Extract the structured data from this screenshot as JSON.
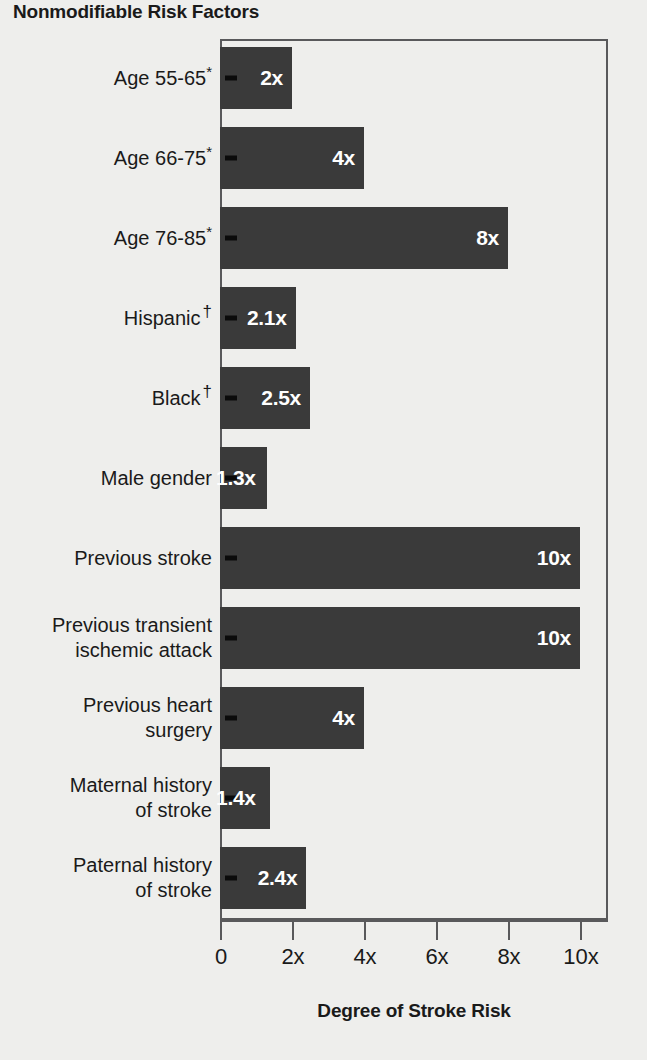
{
  "chart_data": {
    "type": "bar",
    "orientation": "horizontal",
    "title": "Nonmodifiable Risk Factors",
    "xlabel": "Degree of Stroke Risk",
    "ylabel": "",
    "xlim": [
      0,
      10.8
    ],
    "grid": false,
    "legend": null,
    "tick_labels": [
      "0",
      "2x",
      "4x",
      "6x",
      "8x",
      "10x"
    ],
    "tick_values": [
      0,
      2,
      4,
      6,
      8,
      10
    ],
    "categories": [
      "Age 55-65*",
      "Age 66-75*",
      "Age 76-85*",
      "Hispanic †",
      "Black †",
      "Male gender",
      "Previous stroke",
      "Previous transient ischemic attack",
      "Previous heart surgery",
      "Maternal history of stroke",
      "Paternal history of stroke"
    ],
    "values": [
      2,
      4,
      8,
      2.1,
      2.5,
      1.3,
      10,
      10,
      4,
      1.4,
      2.4
    ],
    "value_labels": [
      "2x",
      "4x",
      "8x",
      "2.1x",
      "2.5x",
      "1.3x",
      "10x",
      "10x",
      "4x",
      "1.4x",
      "2.4x"
    ],
    "bar_color": "#3a3a3a",
    "value_label_color": "#ffffff",
    "background_color": "#eeeeec",
    "axis_color": "#59595b",
    "footnote_markers": [
      "*",
      "†"
    ]
  },
  "rows": [
    {
      "label_line1": "Age 55-65",
      "label_line2": "",
      "marker": "*",
      "marker_style": "sup",
      "value": 2,
      "value_label": "2x",
      "label_overflow": false
    },
    {
      "label_line1": "Age 66-75",
      "label_line2": "",
      "marker": "*",
      "marker_style": "sup",
      "value": 4,
      "value_label": "4x",
      "label_overflow": false
    },
    {
      "label_line1": "Age 76-85",
      "label_line2": "",
      "marker": "*",
      "marker_style": "sup",
      "value": 8,
      "value_label": "8x",
      "label_overflow": false
    },
    {
      "label_line1": "Hispanic",
      "label_line2": "",
      "marker": "†",
      "marker_style": "dag",
      "value": 2.1,
      "value_label": "2.1x",
      "label_overflow": false
    },
    {
      "label_line1": "Black",
      "label_line2": "",
      "marker": "†",
      "marker_style": "dag",
      "value": 2.5,
      "value_label": "2.5x",
      "label_overflow": false
    },
    {
      "label_line1": "Male gender",
      "label_line2": "",
      "marker": "",
      "marker_style": "",
      "value": 1.3,
      "value_label": "1.3x",
      "label_overflow": true
    },
    {
      "label_line1": "Previous stroke",
      "label_line2": "",
      "marker": "",
      "marker_style": "",
      "value": 10,
      "value_label": "10x",
      "label_overflow": false
    },
    {
      "label_line1": "Previous transient",
      "label_line2": "ischemic attack",
      "marker": "",
      "marker_style": "",
      "value": 10,
      "value_label": "10x",
      "label_overflow": false
    },
    {
      "label_line1": "Previous heart",
      "label_line2": "surgery",
      "marker": "",
      "marker_style": "",
      "value": 4,
      "value_label": "4x",
      "label_overflow": false
    },
    {
      "label_line1": "Maternal history",
      "label_line2": "of stroke",
      "marker": "",
      "marker_style": "",
      "value": 1.4,
      "value_label": "1.4x",
      "label_overflow": true
    },
    {
      "label_line1": "Paternal history",
      "label_line2": "of stroke",
      "marker": "",
      "marker_style": "",
      "value": 2.4,
      "value_label": "2.4x",
      "label_overflow": false
    }
  ]
}
